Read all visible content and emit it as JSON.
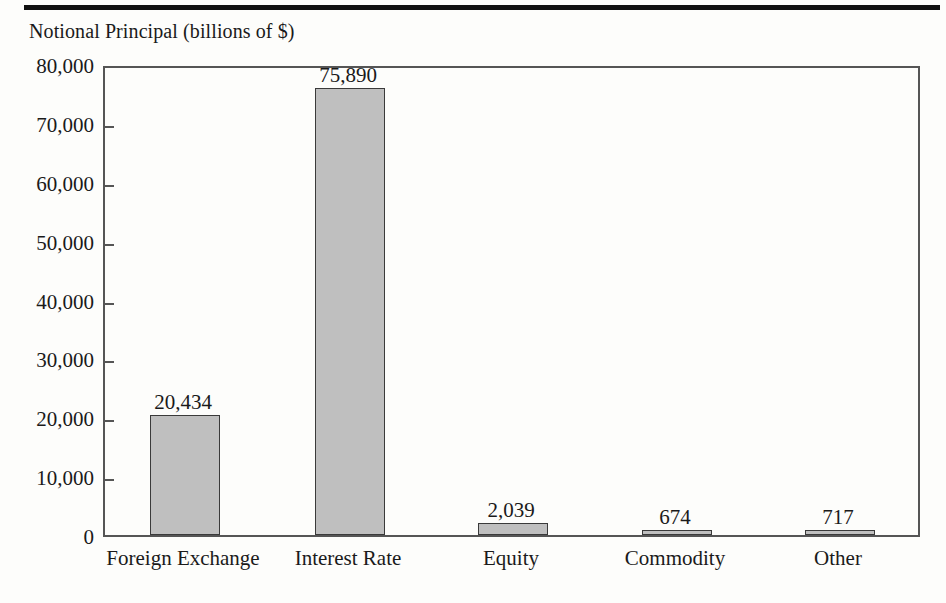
{
  "chart_data": {
    "type": "bar",
    "title": "Notional Principal (billions of $)",
    "xlabel": "",
    "ylabel": "",
    "categories": [
      "Foreign Exchange",
      "Interest Rate",
      "Equity",
      "Commodity",
      "Other"
    ],
    "values": [
      20434,
      75890,
      2039,
      674,
      717
    ],
    "value_labels": [
      "20,434",
      "75,890",
      "2,039",
      "674",
      "717"
    ],
    "ylim": [
      0,
      80000
    ],
    "ytick_values": [
      0,
      10000,
      20000,
      30000,
      40000,
      50000,
      60000,
      70000,
      80000
    ],
    "ytick_labels": [
      "0",
      "10,000",
      "20,000",
      "30,000",
      "40,000",
      "50,000",
      "60,000",
      "70,000",
      "80,000"
    ],
    "grid": false,
    "legend": null,
    "bar_fill_color": "#bfbfbf",
    "bar_border_color": "#3a3a3a",
    "axis_color": "#555555",
    "background_color": "#fdfdfb"
  }
}
